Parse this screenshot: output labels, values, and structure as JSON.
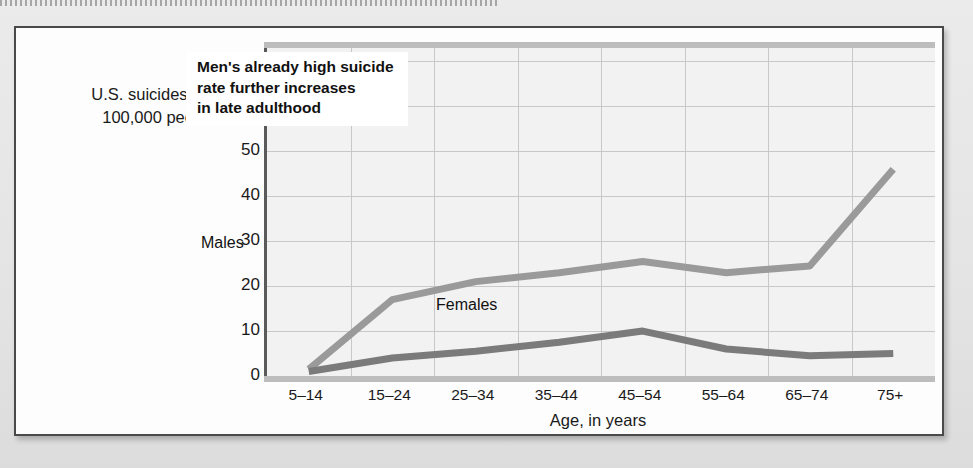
{
  "figure": {
    "annotation": [
      "Men's already high suicide",
      "rate further increases",
      "in late adulthood"
    ],
    "y_axis_title_lines": [
      "U.S. suicides per",
      "100,000 people"
    ],
    "x_axis_title": "Age, in years"
  },
  "colors": {
    "males_line": "#9a9a9a",
    "females_line": "#7b7b7b",
    "plot_background": "#f2f2f2",
    "gridline": "#c8c8c8",
    "axis": "#5a5a5a",
    "card_border": "#4a4a4a",
    "page_background": "#e9e9e9",
    "text": "#1a1a1a"
  },
  "chart_data": {
    "type": "line",
    "title": "",
    "subtitle": "",
    "xlabel": "Age, in years",
    "ylabel": "U.S. suicides per 100,000 people",
    "categories": [
      "5–14",
      "15–24",
      "25–34",
      "35–44",
      "45–54",
      "55–64",
      "65–74",
      "75+"
    ],
    "yticks": [
      0,
      10,
      20,
      30,
      40,
      50,
      60,
      70
    ],
    "ytick_labels": [
      "0",
      "10",
      "20",
      "30",
      "40",
      "50",
      "60",
      "70"
    ],
    "ylim": [
      0,
      73
    ],
    "grid": true,
    "legend": "inline-labels",
    "series": [
      {
        "name": "Males",
        "color": "#9a9a9a",
        "values": [
          1.5,
          17,
          21,
          23,
          25.5,
          23,
          24.5,
          46
        ]
      },
      {
        "name": "Females",
        "color": "#7b7b7b",
        "values": [
          1,
          4,
          5.5,
          7.5,
          10,
          6,
          4.5,
          5
        ]
      }
    ],
    "annotations": [
      {
        "text": "Men's already high suicide rate further increases in late adulthood",
        "x": "25–34",
        "y": 63
      }
    ]
  }
}
